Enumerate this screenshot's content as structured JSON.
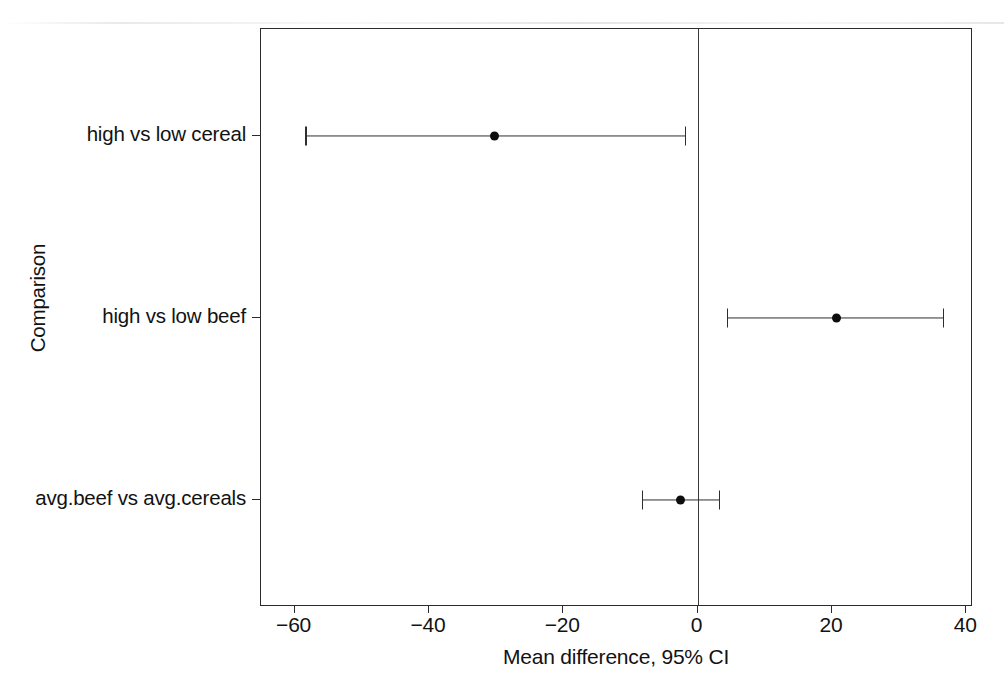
{
  "chart_data": {
    "type": "scatter",
    "subtype": "forest-plot",
    "title": "",
    "xlabel": "Mean difference, 95% CI",
    "ylabel": "Comparison",
    "xlim": [
      -65,
      41
    ],
    "xticks": [
      -60,
      -40,
      -20,
      0,
      40
    ],
    "xtick_labels": [
      "−60",
      "−40",
      "−20",
      "0",
      "20",
      "40"
    ],
    "xtick_values": [
      -60,
      -40,
      -20,
      0,
      20,
      40
    ],
    "grid": false,
    "legend": "none",
    "reference_line": 0,
    "categories": [
      "high vs low cereal",
      "high vs low beef",
      "avg.beef vs avg.cereals"
    ],
    "values": [
      -30.2,
      20.7,
      -2.5
    ],
    "ci_low": [
      -58.4,
      4.4,
      -8.3
    ],
    "ci_high": [
      -1.9,
      36.5,
      3.2
    ],
    "points": [
      {
        "label": "high vs low cereal",
        "estimate": -30.2,
        "ci_low": -58.4,
        "ci_high": -1.9
      },
      {
        "label": "high vs low beef",
        "estimate": 20.7,
        "ci_low": 4.4,
        "ci_high": 36.5
      },
      {
        "label": "avg.beef vs avg.cereals",
        "estimate": -2.5,
        "ci_low": -8.3,
        "ci_high": 3.2
      }
    ],
    "colors": {
      "marker": "#0d0d0d",
      "line": "#2e2e2e",
      "axis": "#2b2b2b",
      "background": "#ffffff",
      "text": "#121212"
    }
  }
}
